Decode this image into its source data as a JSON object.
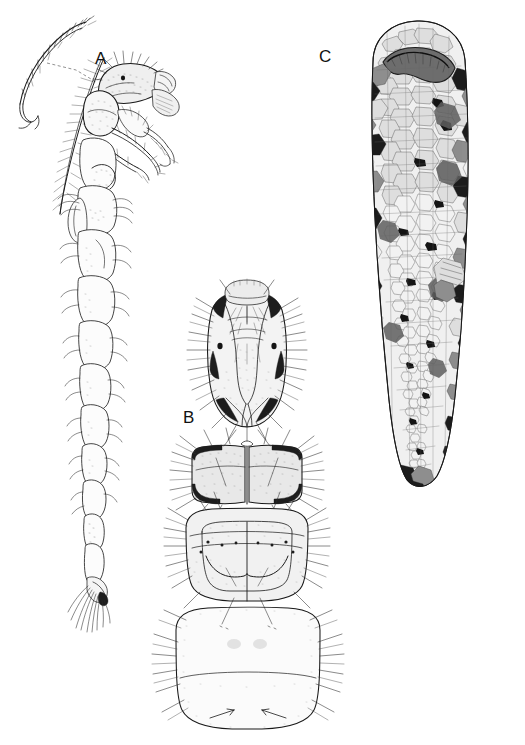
{
  "figure": {
    "kind": "scientific-illustration-plate",
    "background_color": "#ffffff",
    "ink_color": "#1b1b1b",
    "width": 525,
    "height": 745
  },
  "panels": [
    {
      "id": "A",
      "label": "A",
      "label_x": 95,
      "label_y": 50,
      "caption": "larva, lateral view",
      "inset": "tarsal claw detail, upper left, joined by dashed leader line"
    },
    {
      "id": "B",
      "label": "B",
      "label_x": 183,
      "label_y": 409,
      "caption": "head and thoracic nota, dorsal view"
    },
    {
      "id": "C",
      "label": "C",
      "label_x": 319,
      "label_y": 48,
      "caption": "larval case, dorsal view, built of mineral grains"
    }
  ],
  "case_grains": {
    "tone_dark": "#1d1d1d",
    "tone_mid": "#8e8e8e",
    "tone_light": "#dedede",
    "tone_pale": "#f2f2f2"
  }
}
